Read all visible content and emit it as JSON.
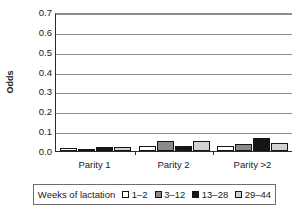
{
  "chart_data": {
    "type": "bar",
    "title": "",
    "xlabel": "",
    "ylabel": "Odds",
    "ylim": [
      0.0,
      0.7
    ],
    "ytick_labels": [
      "0.7",
      "0.6",
      "0.5",
      "0.4",
      "0.3",
      "0.2",
      "0.1",
      "0.0"
    ],
    "ytick_values": [
      0.7,
      0.6,
      0.5,
      0.4,
      0.3,
      0.2,
      0.1,
      0.0
    ],
    "grid": "horizontal",
    "legend_position": "bottom",
    "legend_title": "Weeks of lactation",
    "categories": [
      "Parity 1",
      "Parity 2",
      "Parity >2"
    ],
    "series": [
      {
        "name": "1–2",
        "color": "#ffffff",
        "values": [
          0.014,
          0.025,
          0.025
        ]
      },
      {
        "name": "3–12",
        "color": "#8a8a8a",
        "values": [
          0.008,
          0.051,
          0.034
        ]
      },
      {
        "name": "13–28",
        "color": "#161616",
        "values": [
          0.019,
          0.026,
          0.066
        ]
      },
      {
        "name": "29–44",
        "color": "#d2d2d2",
        "values": [
          0.022,
          0.051,
          0.042
        ]
      }
    ]
  },
  "axis": {
    "y_title": "Odds"
  },
  "colors": {
    "gridline": "#8d8d8d",
    "axis": "#2b2b2b",
    "bar_border": "#141414",
    "legend_border": "#6e6e6e"
  }
}
